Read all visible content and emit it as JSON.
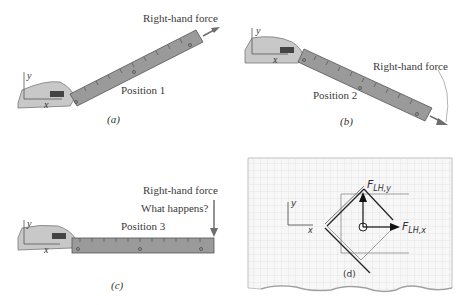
{
  "figure": {
    "panels": [
      {
        "id": "a",
        "caption": "(a)",
        "position_label": "Position 1",
        "force_label": "Right-hand force",
        "axis_x": "x",
        "axis_y": "y"
      },
      {
        "id": "b",
        "caption": "(b)",
        "position_label": "Position 2",
        "force_label": "Right-hand force",
        "axis_x": "x",
        "axis_y": "y"
      },
      {
        "id": "c",
        "caption": "(c)",
        "position_label": "Position 3",
        "force_label": "Right-hand force",
        "question": "What happens?",
        "axis_x": "x",
        "axis_y": "y"
      },
      {
        "id": "d",
        "caption": "(d)",
        "force_y_label": "F",
        "force_y_sub": "LH,y",
        "force_x_label": "F",
        "force_x_sub": "LH,x",
        "axis_x": "x",
        "axis_y": "y"
      }
    ]
  },
  "colors": {
    "ruler_fill": "#9a9a9a",
    "ruler_edge": "#555555",
    "hand_fill": "#c8c8c8",
    "arrow": "#6e6e6e",
    "grid_line": "#d8d8d8",
    "paper": "#f7f7f7"
  }
}
